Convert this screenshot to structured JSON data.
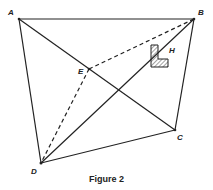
{
  "figure": {
    "caption": "Figure 2",
    "points": {
      "A": {
        "label": "A",
        "x": 19,
        "y": 19
      },
      "B": {
        "label": "B",
        "x": 194,
        "y": 19
      },
      "C": {
        "label": "C",
        "x": 175,
        "y": 130
      },
      "D": {
        "label": "D",
        "x": 41,
        "y": 163
      },
      "E": {
        "label": "E",
        "x": 89,
        "y": 69
      }
    },
    "shape_label": "H",
    "solid_edges": [
      "AB",
      "BC",
      "CD",
      "DA",
      "AC",
      "BD"
    ],
    "dashed_edges": [
      "EB",
      "ED"
    ],
    "colors": {
      "line": "#222222",
      "hatch": "#444444"
    }
  }
}
